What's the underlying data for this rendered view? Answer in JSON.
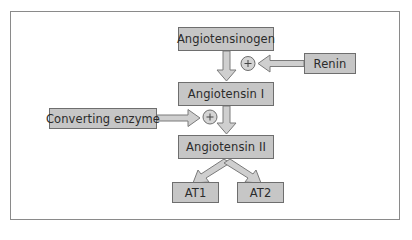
{
  "diagram": {
    "nodes": {
      "angiotensinogen": "Angiotensinogen",
      "renin": "Renin",
      "angiotensin_i": "Angiotensin I",
      "converting_enzyme": "Converting enzyme",
      "angiotensin_ii": "Angiotensin II",
      "at1": "AT1",
      "at2": "AT2"
    },
    "symbols": {
      "plus": "+"
    },
    "edges": [
      {
        "from": "Angiotensinogen",
        "to": "Angiotensin I"
      },
      {
        "from": "Renin",
        "to": "Angiotensinogen → Angiotensin I",
        "effect": "+"
      },
      {
        "from": "Angiotensin I",
        "to": "Angiotensin II"
      },
      {
        "from": "Converting enzyme",
        "to": "Angiotensin I → Angiotensin II",
        "effect": "+"
      },
      {
        "from": "Angiotensin II",
        "to": "AT1"
      },
      {
        "from": "Angiotensin II",
        "to": "AT2"
      }
    ],
    "colors": {
      "box_fill": "#c6c6c6",
      "box_border": "#6e6e6e",
      "arrow_fill": "#cfcfcf",
      "arrow_stroke": "#7a7a7a",
      "text": "#2b2b2b"
    }
  }
}
